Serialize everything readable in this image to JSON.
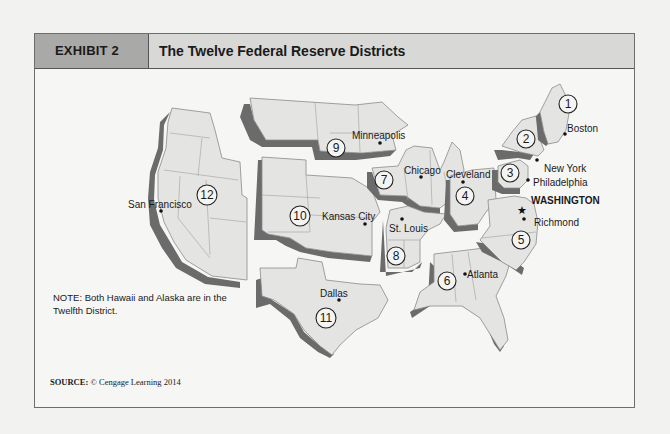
{
  "header": {
    "exhibit_label": "EXHIBIT 2",
    "title": "The Twelve Federal Reserve Districts"
  },
  "map": {
    "districts": [
      {
        "number": "1",
        "city": "Boston"
      },
      {
        "number": "2",
        "city": "New York"
      },
      {
        "number": "3",
        "city": "Philadelphia"
      },
      {
        "number": "4",
        "city": "Cleveland"
      },
      {
        "number": "5",
        "city": "Richmond"
      },
      {
        "number": "6",
        "city": "Atlanta"
      },
      {
        "number": "7",
        "city": "Chicago"
      },
      {
        "number": "8",
        "city": "St. Louis"
      },
      {
        "number": "9",
        "city": "Minneapolis"
      },
      {
        "number": "10",
        "city": "Kansas City"
      },
      {
        "number": "11",
        "city": "Dallas"
      },
      {
        "number": "12",
        "city": "San Francisco"
      }
    ],
    "capital_label": "WASHINGTON",
    "colors": {
      "land": "#e4e4e2",
      "shadow": "#6b6b6b",
      "border": "#8a8a8a"
    }
  },
  "note": "NOTE: Both Hawaii and Alaska are in the Twelfth District.",
  "source": {
    "label": "SOURCE:",
    "text": "© Cengage Learning 2014"
  }
}
